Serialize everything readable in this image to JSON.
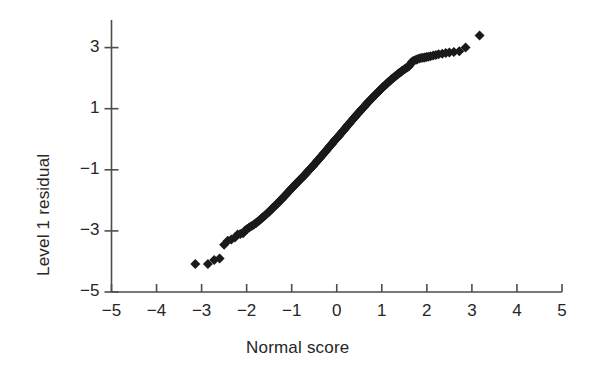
{
  "chart_data": {
    "type": "scatter",
    "title": "",
    "subtitle": "",
    "xlabel": "Normal score",
    "ylabel": "Level 1 residual",
    "xlim": [
      -5,
      5
    ],
    "ylim": [
      -5,
      4
    ],
    "xticks": [
      -5,
      -4,
      -3,
      -2,
      -1,
      0,
      1,
      2,
      3,
      4,
      5
    ],
    "xticklabels": [
      "−5",
      "−4",
      "−3",
      "−2",
      "−1",
      "0",
      "1",
      "2",
      "3",
      "4",
      "5"
    ],
    "yticks": [
      3,
      1,
      -1,
      -3,
      -5
    ],
    "yticklabels": [
      "3",
      "1",
      "−1",
      "−3",
      "−5"
    ],
    "grid": false,
    "legend": null,
    "marker": "diamond",
    "marker_color": "#1a1a1a",
    "marker_size": 5,
    "axis_color": "#4d4d4d",
    "background": "#ffffff",
    "series": [
      {
        "name": "Level 1 residual vs normal score",
        "x": [
          -3.14,
          -2.86,
          -2.72,
          -2.6,
          -2.5,
          -2.42,
          -2.34,
          -2.26,
          -2.2,
          -2.14,
          -2.08,
          -2.03,
          -1.99,
          -1.95,
          -1.91,
          -1.87,
          -1.83,
          -1.79,
          -1.76,
          -1.72,
          -1.69,
          -1.66,
          -1.63,
          -1.6,
          -1.57,
          -1.54,
          -1.51,
          -1.48,
          -1.45,
          -1.43,
          -1.4,
          -1.37,
          -1.35,
          -1.32,
          -1.3,
          -1.27,
          -1.25,
          -1.22,
          -1.2,
          -1.18,
          -1.15,
          -1.13,
          -1.11,
          -1.09,
          -1.07,
          -1.04,
          -1.02,
          -1.0,
          -0.98,
          -0.96,
          -0.94,
          -0.92,
          -0.9,
          -0.88,
          -0.86,
          -0.84,
          -0.82,
          -0.8,
          -0.78,
          -0.76,
          -0.74,
          -0.72,
          -0.7,
          -0.68,
          -0.66,
          -0.65,
          -0.63,
          -0.61,
          -0.59,
          -0.57,
          -0.55,
          -0.53,
          -0.52,
          -0.5,
          -0.48,
          -0.46,
          -0.44,
          -0.43,
          -0.41,
          -0.39,
          -0.37,
          -0.36,
          -0.34,
          -0.32,
          -0.3,
          -0.29,
          -0.27,
          -0.25,
          -0.23,
          -0.22,
          -0.2,
          -0.18,
          -0.17,
          -0.15,
          -0.13,
          -0.11,
          -0.1,
          -0.08,
          -0.06,
          -0.05,
          -0.03,
          -0.01,
          0.01,
          0.03,
          0.05,
          0.06,
          0.08,
          0.1,
          0.11,
          0.13,
          0.15,
          0.17,
          0.18,
          0.2,
          0.22,
          0.23,
          0.25,
          0.27,
          0.29,
          0.3,
          0.32,
          0.34,
          0.36,
          0.37,
          0.39,
          0.41,
          0.43,
          0.44,
          0.46,
          0.48,
          0.5,
          0.52,
          0.53,
          0.55,
          0.57,
          0.59,
          0.61,
          0.63,
          0.65,
          0.66,
          0.68,
          0.7,
          0.72,
          0.74,
          0.76,
          0.78,
          0.8,
          0.82,
          0.84,
          0.86,
          0.88,
          0.9,
          0.92,
          0.94,
          0.96,
          0.98,
          1.0,
          1.02,
          1.04,
          1.07,
          1.09,
          1.11,
          1.13,
          1.15,
          1.18,
          1.2,
          1.22,
          1.25,
          1.27,
          1.3,
          1.32,
          1.35,
          1.37,
          1.4,
          1.43,
          1.45,
          1.48,
          1.51,
          1.54,
          1.57,
          1.6,
          1.63,
          1.66,
          1.69,
          1.72,
          1.76,
          1.79,
          1.83,
          1.87,
          1.91,
          1.95,
          1.99,
          2.03,
          2.08,
          2.14,
          2.2,
          2.26,
          2.34,
          2.42,
          2.5,
          2.6,
          2.72,
          2.86,
          3.17
        ],
        "y": [
          -4.08,
          -4.08,
          -3.95,
          -3.9,
          -3.45,
          -3.32,
          -3.28,
          -3.22,
          -3.12,
          -3.1,
          -3.08,
          -2.98,
          -2.94,
          -2.9,
          -2.86,
          -2.82,
          -2.78,
          -2.74,
          -2.7,
          -2.66,
          -2.62,
          -2.58,
          -2.54,
          -2.5,
          -2.46,
          -2.42,
          -2.38,
          -2.34,
          -2.3,
          -2.26,
          -2.22,
          -2.18,
          -2.15,
          -2.11,
          -2.07,
          -2.03,
          -2.0,
          -1.96,
          -1.92,
          -1.89,
          -1.85,
          -1.82,
          -1.78,
          -1.75,
          -1.71,
          -1.68,
          -1.64,
          -1.61,
          -1.58,
          -1.54,
          -1.51,
          -1.48,
          -1.45,
          -1.42,
          -1.39,
          -1.36,
          -1.33,
          -1.3,
          -1.27,
          -1.24,
          -1.21,
          -1.18,
          -1.15,
          -1.12,
          -1.09,
          -1.06,
          -1.03,
          -1.0,
          -0.97,
          -0.94,
          -0.91,
          -0.88,
          -0.85,
          -0.82,
          -0.79,
          -0.76,
          -0.73,
          -0.7,
          -0.67,
          -0.64,
          -0.61,
          -0.58,
          -0.55,
          -0.52,
          -0.49,
          -0.46,
          -0.43,
          -0.4,
          -0.37,
          -0.34,
          -0.31,
          -0.28,
          -0.25,
          -0.22,
          -0.19,
          -0.16,
          -0.13,
          -0.1,
          -0.07,
          -0.04,
          -0.01,
          0.02,
          0.05,
          0.08,
          0.11,
          0.14,
          0.17,
          0.2,
          0.23,
          0.26,
          0.29,
          0.32,
          0.35,
          0.38,
          0.41,
          0.44,
          0.47,
          0.5,
          0.53,
          0.56,
          0.59,
          0.62,
          0.65,
          0.68,
          0.71,
          0.74,
          0.77,
          0.8,
          0.83,
          0.86,
          0.89,
          0.92,
          0.95,
          0.98,
          1.01,
          1.04,
          1.07,
          1.1,
          1.13,
          1.16,
          1.19,
          1.22,
          1.25,
          1.28,
          1.31,
          1.34,
          1.37,
          1.4,
          1.43,
          1.46,
          1.49,
          1.52,
          1.55,
          1.58,
          1.61,
          1.64,
          1.67,
          1.7,
          1.73,
          1.76,
          1.79,
          1.82,
          1.85,
          1.88,
          1.91,
          1.94,
          1.97,
          2.0,
          2.03,
          2.06,
          2.09,
          2.12,
          2.15,
          2.18,
          2.21,
          2.24,
          2.27,
          2.3,
          2.33,
          2.36,
          2.38,
          2.45,
          2.52,
          2.55,
          2.58,
          2.6,
          2.62,
          2.64,
          2.66,
          2.67,
          2.68,
          2.69,
          2.7,
          2.72,
          2.74,
          2.76,
          2.78,
          2.8,
          2.82,
          2.84,
          2.86,
          2.88,
          3.0,
          3.4
        ]
      }
    ]
  }
}
